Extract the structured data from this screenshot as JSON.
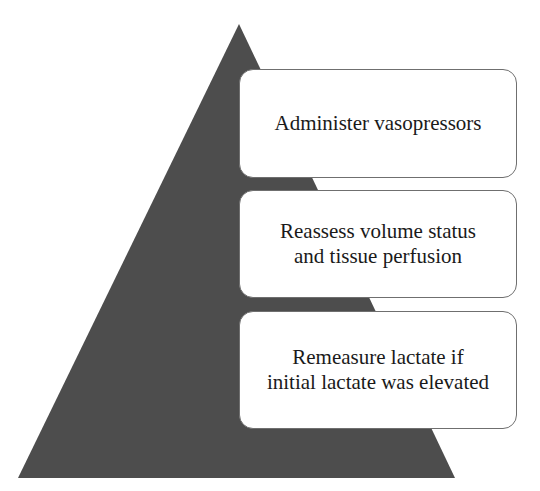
{
  "diagram": {
    "type": "pyramid",
    "pyramid_color": "#4a4a4a",
    "levels": [
      {
        "label": "Administer vasopressors"
      },
      {
        "label": "Reassess volume status\nand tissue perfusion"
      },
      {
        "label": "Remeasure lactate if\ninitial lactate was elevated"
      }
    ]
  }
}
